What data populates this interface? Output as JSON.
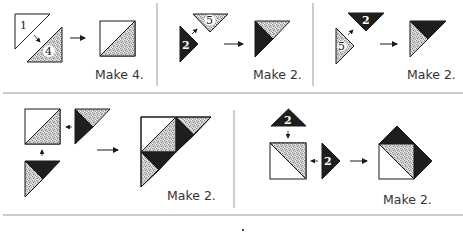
{
  "colors": {
    "background": "#ffffff",
    "outline": "#1a1a1a",
    "dark_fabric": "#1e1e1e",
    "light_fabric": "#c9c9c9",
    "white_fabric": "#ffffff",
    "divider": "#999999",
    "caption_text": "#333333"
  },
  "panels": [
    {
      "id": "panel-1",
      "pieces": [
        {
          "label": "1",
          "fabric": "white"
        },
        {
          "label": "4",
          "fabric": "light"
        }
      ],
      "result": "half-square triangle unit (white + speckled)",
      "caption": "Make 4."
    },
    {
      "id": "panel-2",
      "pieces": [
        {
          "label": "2",
          "fabric": "dark"
        },
        {
          "label": "5",
          "fabric": "light"
        }
      ],
      "result": "large triangle: dark left, speckled top",
      "caption": "Make 2."
    },
    {
      "id": "panel-3",
      "pieces": [
        {
          "label": "2",
          "fabric": "dark"
        },
        {
          "label": "5",
          "fabric": "light"
        }
      ],
      "result": "large triangle: dark top, speckled left",
      "caption": "Make 2."
    },
    {
      "id": "panel-4",
      "pieces": [
        {
          "label": "",
          "fabric": "half-square unit"
        },
        {
          "label": "",
          "fabric": "triangle unit (dark/speckled)"
        },
        {
          "label": "",
          "fabric": "triangle unit (dark/speckled)"
        }
      ],
      "result": "pieced large triangle",
      "caption": "Make 2."
    },
    {
      "id": "panel-5",
      "pieces": [
        {
          "label": "2",
          "fabric": "dark"
        },
        {
          "label": "",
          "fabric": "half-square unit"
        },
        {
          "label": "2",
          "fabric": "dark"
        }
      ],
      "result": "square with two dark corner triangles",
      "caption": "Make 2."
    }
  ]
}
